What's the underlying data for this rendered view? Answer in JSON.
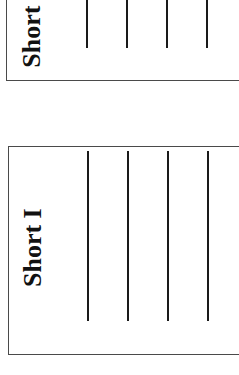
{
  "cards": [
    {
      "label": "Short I",
      "lines": 4,
      "position": "top",
      "clipped": true
    },
    {
      "label": "Short I",
      "lines": 4,
      "position": "bottom"
    }
  ],
  "colors": {
    "border": "#4a4a4a",
    "line": "#1a1a1a",
    "text": "#111111",
    "background": "#ffffff"
  }
}
